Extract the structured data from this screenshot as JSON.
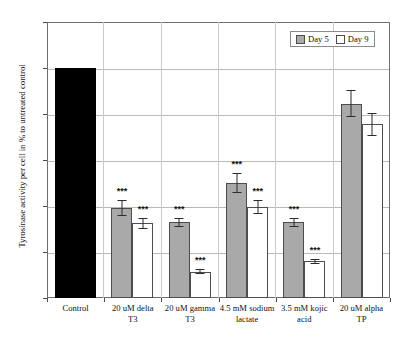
{
  "chart_data": {
    "type": "bar",
    "title": "",
    "xlabel": "",
    "ylabel": "Tyrosinase activity per cell in % to untreated control",
    "ylim": [
      0,
      120
    ],
    "yticks": [
      0,
      20,
      40,
      60,
      80,
      100,
      120
    ],
    "grid": true,
    "legend_position": "top-right",
    "categories": [
      "Control",
      "20 uM delta T3",
      "20 uM gamma T3",
      "4.5 mM sodium lactate",
      "3.5 mM kojic acid",
      "20 uM alpha TP"
    ],
    "series": [
      {
        "name": "Day 5",
        "color": "#a9a9a9",
        "values": [
          100,
          39,
          33,
          50,
          33,
          84.5
        ],
        "errors": [
          0,
          3.5,
          2,
          4.5,
          2,
          6
        ],
        "significance": [
          "",
          "***",
          "***",
          "***",
          "***",
          ""
        ]
      },
      {
        "name": "Day 9",
        "color": "#ffffff",
        "values": [
          null,
          32.5,
          11.5,
          39.5,
          16,
          75.5
        ],
        "errors": [
          0,
          2.5,
          1,
          3,
          1,
          5
        ],
        "significance": [
          "",
          "***",
          "***",
          "***",
          "***",
          ""
        ]
      }
    ],
    "control_bar": {
      "label": "Control",
      "value": 100,
      "color": "#000000"
    }
  },
  "legend": {
    "items": [
      {
        "label": "Day 5",
        "swatch": "day5"
      },
      {
        "label": "Day 9",
        "swatch": "day9"
      }
    ]
  },
  "axis": {
    "y_title": "Tyrosinase activity per cell in % to untreated control",
    "y_tick_labels": [
      "120",
      "100",
      "80",
      "60",
      "40",
      "20",
      "0"
    ]
  },
  "x_labels": [
    {
      "line1": "Control",
      "line2": ""
    },
    {
      "line1": "20 uM delta",
      "line2": "T3"
    },
    {
      "line1": "20 uM gamma",
      "line2": "T3"
    },
    {
      "line1": "4.5 mM sodium",
      "line2": "lactate"
    },
    {
      "line1": "3.5 mM kojic",
      "line2": "acid"
    },
    {
      "line1": "20 uM alpha TP",
      "line2": ""
    }
  ],
  "significance_marker": "***"
}
